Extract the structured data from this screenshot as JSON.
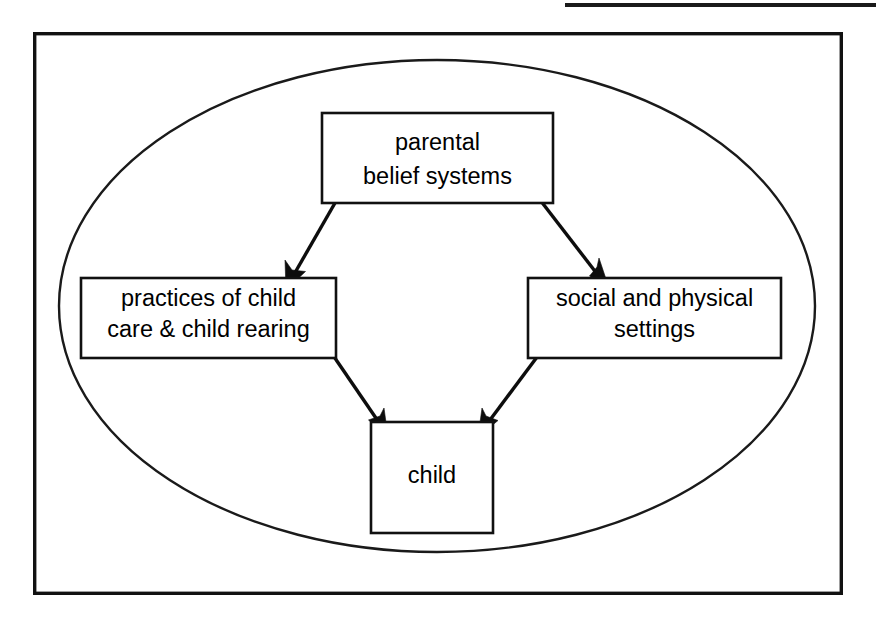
{
  "figure": {
    "top_rule": {
      "name": "top-rule-line",
      "x1": 565,
      "x2": 876,
      "y": 5
    },
    "frame": {
      "label": "outer frame",
      "x": 33,
      "y": 32,
      "width": 810,
      "height": 563
    },
    "ellipse": {
      "label": "cultural context ellipse",
      "cx": 437,
      "cy": 306,
      "rx": 378,
      "ry": 246
    },
    "colors": {
      "ink": "#111111",
      "background": "#ffffff",
      "arrow": "#0d0d0d"
    }
  },
  "nodes": [
    {
      "id": "parental-belief-systems",
      "lines": [
        "parental",
        "belief systems"
      ],
      "x": 322,
      "y": 113,
      "width": 231,
      "height": 90
    },
    {
      "id": "practices-of-child-care",
      "lines": [
        "practices of child",
        "care & child rearing"
      ],
      "x": 81,
      "y": 278,
      "width": 255,
      "height": 80
    },
    {
      "id": "social-and-physical-settings",
      "lines": [
        "social and physical",
        "settings"
      ],
      "x": 528,
      "y": 278,
      "width": 253,
      "height": 80
    },
    {
      "id": "child",
      "lines": [
        "child"
      ],
      "x": 371,
      "y": 422,
      "width": 122,
      "height": 111
    }
  ],
  "arrows": [
    {
      "id": "beliefs-to-practices",
      "from": "parental-belief-systems",
      "to": "practices-of-child-care",
      "x1": 339,
      "y1": 196,
      "x2": 298,
      "y2": 285
    },
    {
      "id": "beliefs-to-settings",
      "from": "parental-belief-systems",
      "to": "social-and-physical-settings",
      "x1": 537,
      "y1": 196,
      "x2": 606,
      "y2": 287
    },
    {
      "id": "practices-to-child",
      "from": "practices-of-child-care",
      "to": "child",
      "x1": 326,
      "y1": 345,
      "x2": 385,
      "y2": 432
    },
    {
      "id": "settings-to-child",
      "from": "social-and-physical-settings",
      "to": "child",
      "x1": 546,
      "y1": 345,
      "x2": 477,
      "y2": 432
    }
  ]
}
